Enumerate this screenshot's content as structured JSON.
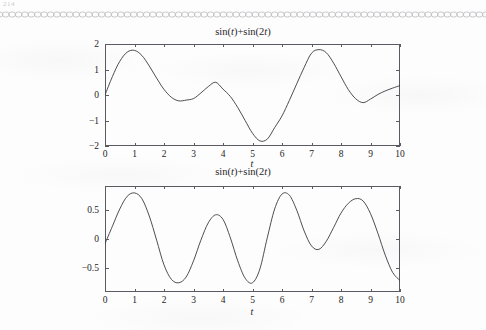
{
  "page": {
    "corner_mark": "214",
    "background_color": "#fdfdfd",
    "ink_color": "#3a3a40",
    "border_ornament": "chain-rule-ornament"
  },
  "figures": [
    {
      "id": "figure-1",
      "title": "sin(t)+sin(2t)",
      "title_parts": {
        "a": "sin(",
        "var1": "t",
        "b": ")+sin(2",
        "var2": "t",
        "c": ")"
      },
      "xlabel": "t",
      "ylabel": "",
      "xticks": [
        "0",
        "1",
        "2",
        "3",
        "4",
        "5",
        "6",
        "7",
        "8",
        "9",
        "10"
      ],
      "yticks": [
        "2",
        "1",
        "0",
        "−1",
        "−2"
      ],
      "xlim": [
        0,
        10
      ],
      "ylim": [
        -2,
        2
      ]
    },
    {
      "id": "figure-2",
      "title": "sin(t)+sin(2t)",
      "title_parts": {
        "a": "sin(",
        "var1": "t",
        "b": ")+sin(2",
        "var2": "t",
        "c": ")"
      },
      "xlabel": "t",
      "ylabel": "",
      "xticks": [
        "0",
        "1",
        "2",
        "3",
        "4",
        "5",
        "6",
        "7",
        "8",
        "9",
        "10"
      ],
      "yticks": [
        "0.5",
        "0",
        "−0.5"
      ],
      "xlim": [
        0,
        10
      ],
      "ylim": [
        -0.92,
        0.92
      ]
    }
  ],
  "chart_data": [
    {
      "type": "line",
      "title": "sin(t)+sin(2t)",
      "xlabel": "t",
      "ylabel": "",
      "xlim": [
        0,
        10
      ],
      "ylim": [
        -2,
        2
      ],
      "grid": false,
      "legend": "none",
      "xticks": [
        0,
        1,
        2,
        3,
        4,
        5,
        6,
        7,
        8,
        9,
        10
      ],
      "yticks": [
        -2,
        -1,
        0,
        1,
        2
      ],
      "series": [
        {
          "name": "sin(t)+sin(2t)",
          "expression": "sin(t)+sin(2*t)",
          "x": [
            0,
            0.25,
            0.5,
            0.75,
            1,
            1.25,
            1.5,
            1.75,
            2,
            2.25,
            2.5,
            2.75,
            3,
            3.25,
            3.5,
            3.75,
            4,
            4.25,
            4.5,
            4.75,
            5,
            5.25,
            5.5,
            5.75,
            6,
            6.25,
            6.5,
            6.75,
            7,
            7.25,
            7.5,
            7.75,
            8,
            8.25,
            8.5,
            8.75,
            9,
            9.25,
            9.5,
            9.75,
            10
          ],
          "y": [
            0,
            0.72,
            1.32,
            1.68,
            1.75,
            1.55,
            1.14,
            0.66,
            0.22,
            -0.09,
            -0.23,
            -0.2,
            -0.14,
            0.08,
            0.33,
            0.5,
            0.23,
            -0.06,
            -0.49,
            -1.0,
            -1.5,
            -1.8,
            -1.73,
            -1.28,
            -0.82,
            -0.21,
            0.44,
            1.08,
            1.64,
            1.78,
            1.66,
            1.25,
            0.72,
            0.21,
            -0.15,
            -0.3,
            -0.16,
            0.02,
            0.16,
            0.27,
            0.37
          ]
        }
      ]
    },
    {
      "type": "line",
      "title": "sin(t)+sin(2t)",
      "xlabel": "t",
      "ylabel": "",
      "xlim": [
        0,
        10
      ],
      "ylim": [
        -0.92,
        0.92
      ],
      "grid": false,
      "legend": "none",
      "xticks": [
        0,
        1,
        2,
        3,
        4,
        5,
        6,
        7,
        8,
        9,
        10
      ],
      "yticks": [
        -0.5,
        0,
        0.5
      ],
      "series": [
        {
          "name": "sin(t)+sin(2t) normalized",
          "expression": "sin(t)*sin(2*t) form",
          "x": [
            0,
            0.25,
            0.5,
            0.75,
            1,
            1.25,
            1.5,
            1.75,
            2,
            2.25,
            2.5,
            2.75,
            3,
            3.25,
            3.5,
            3.75,
            4,
            4.25,
            4.5,
            4.75,
            5,
            5.25,
            5.5,
            5.75,
            6,
            6.25,
            6.5,
            6.75,
            7,
            7.25,
            7.5,
            7.75,
            8,
            8.25,
            8.5,
            8.75,
            9,
            9.25,
            9.5,
            9.75,
            10
          ],
          "y": [
            -0.08,
            0.22,
            0.52,
            0.74,
            0.8,
            0.7,
            0.4,
            -0.02,
            -0.45,
            -0.7,
            -0.76,
            -0.66,
            -0.38,
            -0.02,
            0.28,
            0.42,
            0.34,
            0.02,
            -0.38,
            -0.68,
            -0.76,
            -0.52,
            0.02,
            0.52,
            0.78,
            0.76,
            0.5,
            0.14,
            -0.12,
            -0.18,
            -0.04,
            0.2,
            0.45,
            0.62,
            0.7,
            0.66,
            0.44,
            0.1,
            -0.28,
            -0.58,
            -0.72
          ]
        }
      ]
    }
  ]
}
